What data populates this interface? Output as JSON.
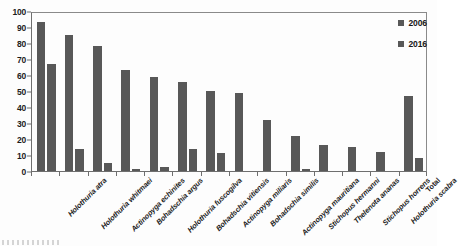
{
  "chart_data": {
    "type": "bar",
    "title": "",
    "xlabel": "",
    "ylabel": "",
    "ylim": [
      0,
      100
    ],
    "yticks": [
      0,
      10,
      20,
      30,
      40,
      50,
      60,
      70,
      80,
      90,
      100
    ],
    "grid": false,
    "legend_position": "top-right",
    "categories": [
      "Holothuria atra",
      "Holothuria whitmaei",
      "Actinopyga echinites",
      "Bohadschia argus",
      "Holothuria fuscogilva",
      "Bohadschia vitiensis",
      "Actinopyga miliaris",
      "Bohadschia similis",
      "Actinopyga mauritiana",
      "Stichopus hermanni",
      "Thelenota ananas",
      "Stichopus horrens",
      "Holothuria scabra",
      "Total"
    ],
    "series": [
      {
        "name": "2006",
        "color": "#585858",
        "values": [
          93,
          85,
          78,
          63,
          59,
          55.5,
          50,
          48.5,
          32,
          22,
          16,
          15,
          12,
          47
        ]
      },
      {
        "name": "2016",
        "color": "#585858",
        "values": [
          67,
          14,
          5,
          1.5,
          2.5,
          14,
          11,
          0,
          0,
          1,
          0,
          0,
          0,
          8
        ]
      }
    ]
  },
  "legend": {
    "items": [
      {
        "label": "2006"
      },
      {
        "label": "2016"
      }
    ]
  },
  "axis": {
    "y_tick_labels": [
      "0",
      "10",
      "20",
      "30",
      "40",
      "50",
      "60",
      "70",
      "80",
      "90",
      "100"
    ]
  }
}
